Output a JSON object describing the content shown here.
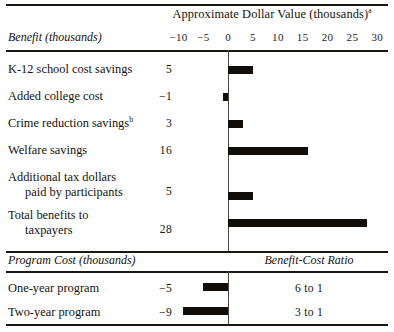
{
  "figure": {
    "axis_title": "Approximate Dollar Value (thousands)",
    "axis_title_superscript": "a",
    "left_column_header": "Benefit (thousands)",
    "cost_section_header": "Program Cost (thousands)",
    "ratio_column_header": "Benefit-Cost Ratio"
  },
  "chart_data": {
    "type": "bar",
    "title": "Approximate Dollar Value (thousands)",
    "xlabel": "Approximate Dollar Value (thousands)",
    "ylabel": "",
    "orientation": "horizontal",
    "xlim": [
      -10,
      30
    ],
    "xticks": [
      -10,
      -5,
      0,
      5,
      10,
      15,
      20,
      25,
      30
    ],
    "xticklabels": [
      "−10",
      "−5",
      "0",
      "5",
      "10",
      "15",
      "20",
      "25",
      "30"
    ],
    "grid": false,
    "legend": "none",
    "zero_line": 0,
    "categories": [
      "K-12 school cost savings",
      "Added college cost",
      "Crime reduction savings",
      "Welfare savings",
      "Additional tax dollars paid by participants",
      "Total benefits to taxpayers",
      "One-year program",
      "Two-year program"
    ],
    "values": [
      5,
      -1,
      3,
      16,
      5,
      28,
      -5,
      -9
    ],
    "annotations": [
      "Crime reduction savings carries footnote b",
      "Axis title carries footnote a",
      "One-year program benefit-cost ratio 6 to 1",
      "Two-year program benefit-cost ratio 3 to 1"
    ]
  },
  "ticks": [
    {
      "label": "−10",
      "value": -10
    },
    {
      "label": "−5",
      "value": -5
    },
    {
      "label": "0",
      "value": 0
    },
    {
      "label": "5",
      "value": 5
    },
    {
      "label": "10",
      "value": 10
    },
    {
      "label": "15",
      "value": 15
    },
    {
      "label": "20",
      "value": 20
    },
    {
      "label": "25",
      "value": 25
    },
    {
      "label": "30",
      "value": 30
    }
  ],
  "benefit_rows": [
    {
      "label": "K-12 school cost savings",
      "label_line2": "",
      "footnote": "",
      "value_text": "5",
      "value": 5
    },
    {
      "label": "Added college cost",
      "label_line2": "",
      "footnote": "",
      "value_text": "−1",
      "value": -1
    },
    {
      "label": "Crime reduction savings",
      "label_line2": "",
      "footnote": "b",
      "value_text": "3",
      "value": 3
    },
    {
      "label": "Welfare savings",
      "label_line2": "",
      "footnote": "",
      "value_text": "16",
      "value": 16
    },
    {
      "label": "Additional tax dollars",
      "label_line2": "paid by participants",
      "footnote": "",
      "value_text": "5",
      "value": 5
    },
    {
      "label": "Total benefits to",
      "label_line2": "taxpayers",
      "footnote": "",
      "value_text": "28",
      "value": 28
    }
  ],
  "cost_rows": [
    {
      "label": "One-year program",
      "value_text": "−5",
      "value": -5,
      "ratio": "6 to 1"
    },
    {
      "label": "Two-year program",
      "value_text": "−9",
      "value": -9,
      "ratio": "3 to 1"
    }
  ],
  "colors": {
    "bar": "#100d0a",
    "rule": "#1b1713",
    "axis": "#4a4644",
    "text": "#15120f",
    "background": "#ffffff"
  }
}
